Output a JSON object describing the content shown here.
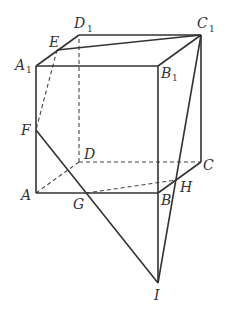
{
  "diagram": {
    "type": "cube-section",
    "points": {
      "A": [
        36,
        193
      ],
      "B": [
        158,
        193
      ],
      "C": [
        201,
        162
      ],
      "D": [
        79,
        162
      ],
      "A1": [
        36,
        66
      ],
      "B1": [
        158,
        66
      ],
      "C1": [
        201,
        35
      ],
      "D1": [
        79,
        35
      ],
      "E": [
        57,
        50
      ],
      "F": [
        36,
        130
      ],
      "G": [
        86,
        193
      ],
      "H": [
        176,
        180
      ],
      "I": [
        158,
        283
      ]
    },
    "labels": {
      "A": "A",
      "B": "B",
      "C": "C",
      "D": "D",
      "A1": "A",
      "B1": "B",
      "C1": "C",
      "D1": "D",
      "sub1": "1",
      "E": "E",
      "F": "F",
      "G": "G",
      "H": "H",
      "I": "I"
    },
    "solid_edges": [
      [
        "A1",
        "B1"
      ],
      [
        "B1",
        "C1"
      ],
      [
        "C1",
        "D1"
      ],
      [
        "D1",
        "A1"
      ],
      [
        "A",
        "A1"
      ],
      [
        "B",
        "B1"
      ],
      [
        "C",
        "C1"
      ],
      [
        "A",
        "B"
      ],
      [
        "B",
        "C"
      ],
      [
        "E",
        "C1"
      ],
      [
        "F",
        "I"
      ],
      [
        "C1",
        "I"
      ],
      [
        "B",
        "I"
      ]
    ],
    "dashed_edges": [
      [
        "D",
        "D1"
      ],
      [
        "A",
        "D"
      ],
      [
        "D",
        "C"
      ],
      [
        "E",
        "F"
      ],
      [
        "G",
        "H"
      ]
    ]
  }
}
